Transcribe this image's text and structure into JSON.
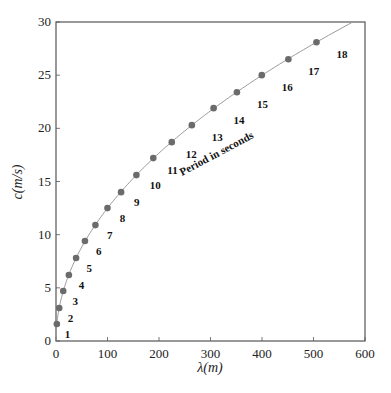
{
  "chart_data": {
    "type": "scatter",
    "title": "",
    "xlabel": "λ(m)",
    "ylabel": "c(m/s)",
    "xlim": [
      0,
      600
    ],
    "ylim": [
      0,
      30
    ],
    "xticks": [
      0,
      100,
      200,
      300,
      400,
      500,
      600
    ],
    "yticks": [
      0,
      5,
      10,
      15,
      20,
      25,
      30
    ],
    "grid": false,
    "legend": null,
    "annotation": "Period in seconds",
    "series": [
      {
        "name": "Wave speed vs wavelength",
        "point_labels": [
          "1",
          "2",
          "3",
          "4",
          "5",
          "6",
          "7",
          "8",
          "9",
          "10",
          "11",
          "12",
          "13",
          "14",
          "15",
          "16",
          "17",
          "18"
        ],
        "x": [
          1.6,
          6.2,
          14.0,
          25.0,
          39.0,
          56.2,
          76.5,
          99.9,
          126.4,
          156.1,
          188.9,
          224.8,
          263.8,
          306.0,
          351.3,
          399.6,
          451.2,
          505.8
        ],
        "y": [
          1.6,
          3.1,
          4.7,
          6.2,
          7.8,
          9.4,
          10.9,
          12.5,
          14.0,
          15.6,
          17.2,
          18.7,
          20.3,
          21.9,
          23.4,
          25.0,
          26.5,
          28.1
        ]
      }
    ],
    "curve": {
      "name": "fit",
      "x_max": 580,
      "formula": "c = sqrt(g*λ/(2π))"
    }
  },
  "colors": {
    "point": "#6b6b6b",
    "curve": "#9a9a9a",
    "axis": "#555555",
    "text": "#222222"
  }
}
